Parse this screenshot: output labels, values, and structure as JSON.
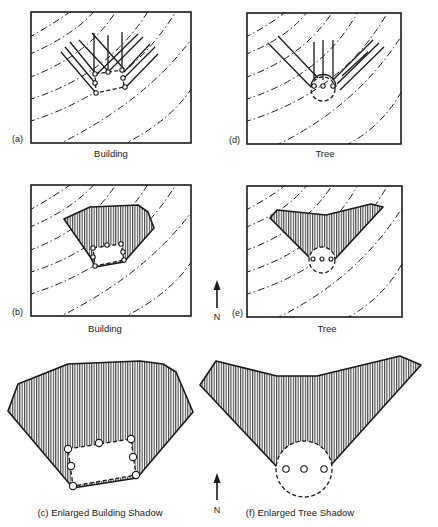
{
  "panels": [
    {
      "id": "a",
      "tag": "(a)",
      "caption": "Building",
      "subject": "building",
      "stage": "sun-ray-projection"
    },
    {
      "id": "b",
      "tag": "(b)",
      "caption": "Building",
      "subject": "building",
      "stage": "shadow-outline"
    },
    {
      "id": "c",
      "tag": "(c)",
      "caption": "Enlarged Building Shadow",
      "subject": "building",
      "stage": "enlarged-shadow"
    },
    {
      "id": "d",
      "tag": "(d)",
      "caption": "Tree",
      "subject": "tree",
      "stage": "sun-ray-projection"
    },
    {
      "id": "e",
      "tag": "(e)",
      "caption": "Tree",
      "subject": "tree",
      "stage": "shadow-outline"
    },
    {
      "id": "f",
      "tag": "(f)",
      "caption": "Enlarged Tree Shadow",
      "subject": "tree",
      "stage": "enlarged-shadow"
    }
  ],
  "captions": {
    "a": "Building",
    "b": "Building",
    "c": "(c)  Enlarged Building Shadow",
    "d": "Tree",
    "e": "Tree",
    "f": "(f)  Enlarged Tree Shadow"
  },
  "tags": {
    "a": "(a)",
    "b": "(b)",
    "d": "(d)",
    "e": "(e)"
  },
  "north_arrows": [
    {
      "label": "N",
      "position": "between panels b and e"
    },
    {
      "label": "N",
      "position": "between panels c and f"
    }
  ],
  "north_label": "N",
  "legend": {
    "contour_lines": "dash-dot",
    "shadow_fill": "vertical hatching",
    "footprint": "dashed outline with circular vertices"
  },
  "colors": {
    "ink": "#1a1a1a",
    "background": "#ffffff"
  }
}
